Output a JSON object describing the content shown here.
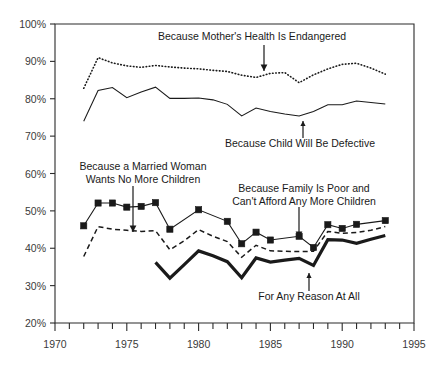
{
  "chart_data": {
    "type": "line",
    "title": "",
    "xlabel": "",
    "ylabel": "",
    "xlim": [
      1970,
      1995
    ],
    "ylim": [
      20,
      100
    ],
    "grid": false,
    "legend_position": "inline-annotations",
    "x_ticks_major": [
      "1970",
      "1975",
      "1980",
      "1985",
      "1990",
      "1995"
    ],
    "x_ticks_minor_step": 1,
    "y_ticks": [
      "20%",
      "30%",
      "40%",
      "50%",
      "60%",
      "70%",
      "80%",
      "90%",
      "100%"
    ],
    "series": [
      {
        "name": "Because Mother's Health Is Endangered",
        "style": "dotted",
        "marker": "none",
        "color": "#1a1a1a",
        "x": [
          1972,
          1973,
          1974,
          1975,
          1976,
          1977,
          1978,
          1979,
          1980,
          1981,
          1982,
          1983,
          1984,
          1985,
          1986,
          1987,
          1988,
          1989,
          1990,
          1991,
          1992,
          1993
        ],
        "values": [
          82.8,
          91.0,
          89.6,
          88.8,
          88.4,
          88.9,
          88.5,
          88.2,
          88.0,
          87.6,
          87.3,
          86.3,
          85.7,
          86.8,
          87.0,
          84.3,
          86.4,
          88.0,
          89.2,
          89.5,
          88.2,
          86.6
        ]
      },
      {
        "name": "Because Child Will Be Defective",
        "style": "solid-thin",
        "marker": "none",
        "color": "#1a1a1a",
        "x": [
          1972,
          1973,
          1974,
          1975,
          1976,
          1977,
          1978,
          1979,
          1980,
          1981,
          1982,
          1983,
          1984,
          1985,
          1986,
          1987,
          1988,
          1989,
          1990,
          1991,
          1992,
          1993
        ],
        "values": [
          74.0,
          82.2,
          83.0,
          80.3,
          81.8,
          83.1,
          80.1,
          80.1,
          80.2,
          79.7,
          78.5,
          75.4,
          77.5,
          76.6,
          75.9,
          75.4,
          76.6,
          78.4,
          78.4,
          79.4,
          79.0,
          78.6
        ]
      },
      {
        "name": "Because a Married Woman Wants No More Children",
        "style": "solid-marker",
        "marker": "square",
        "color": "#1a1a1a",
        "x": [
          1972,
          1973,
          1974,
          1975,
          1976,
          1977,
          1978,
          1980,
          1982,
          1983,
          1984,
          1985,
          1987,
          1988,
          1989,
          1990,
          1991,
          1993
        ],
        "values": [
          46.0,
          52.1,
          52.1,
          51.0,
          51.2,
          52.2,
          45.1,
          50.3,
          47.2,
          41.2,
          44.3,
          42.2,
          43.2,
          40.2,
          46.3,
          45.3,
          46.4,
          47.4
        ]
      },
      {
        "name": "Because Family Is Poor and Can't Afford Any More Children",
        "style": "dashed",
        "marker": "none",
        "color": "#1a1a1a",
        "x": [
          1972,
          1973,
          1974,
          1975,
          1976,
          1977,
          1978,
          1979,
          1980,
          1981,
          1982,
          1983,
          1984,
          1985,
          1986,
          1987,
          1988,
          1989,
          1990,
          1991,
          1992,
          1993
        ],
        "values": [
          37.8,
          45.8,
          45.1,
          44.8,
          44.5,
          44.7,
          39.6,
          42.0,
          45.0,
          43.2,
          41.8,
          37.6,
          40.8,
          39.3,
          39.2,
          39.1,
          39.2,
          44.5,
          44.0,
          44.2,
          44.8,
          45.8
        ]
      },
      {
        "name": "For Any Reason At All",
        "style": "solid-thick",
        "marker": "none",
        "color": "#1a1a1a",
        "x": [
          1977,
          1978,
          1979,
          1980,
          1981,
          1982,
          1983,
          1984,
          1985,
          1986,
          1987,
          1988,
          1989,
          1990,
          1991,
          1992,
          1993
        ],
        "values": [
          36.2,
          32.0,
          35.6,
          39.3,
          38.0,
          36.4,
          32.1,
          37.4,
          36.3,
          36.8,
          37.3,
          35.4,
          42.3,
          42.2,
          41.3,
          42.4,
          43.4
        ]
      }
    ],
    "annotations": [
      {
        "id": "annotation-mothers-health",
        "lines": [
          "Because Mother's Health Is Endangered"
        ],
        "text_x": 252,
        "text_y": 40,
        "arrow_from_x": 264,
        "arrow_from_y": 45,
        "arrow_to_x": 264,
        "arrow_to_y": 71
      },
      {
        "id": "annotation-child-defective",
        "lines": [
          "Because Child Will Be Defective"
        ],
        "text_x": 300,
        "text_y": 147,
        "arrow_from_x": 303,
        "arrow_from_y": 138,
        "arrow_to_x": 303,
        "arrow_to_y": 121
      },
      {
        "id": "annotation-married-woman",
        "lines": [
          "Because a Married Woman",
          "Wants No More Children"
        ],
        "text_x": 143,
        "text_y": 170,
        "arrow_from_x": 133,
        "arrow_from_y": 186,
        "arrow_to_x": 133,
        "arrow_to_y": 232
      },
      {
        "id": "annotation-family-poor",
        "lines": [
          "Because Family Is Poor and",
          "Can't Afford Any More Children"
        ],
        "text_x": 304,
        "text_y": 192,
        "arrow_from_x": 299,
        "arrow_from_y": 207,
        "arrow_to_x": 299,
        "arrow_to_y": 238
      },
      {
        "id": "annotation-any-reason",
        "lines": [
          "For Any Reason At All"
        ],
        "text_x": 309,
        "text_y": 300,
        "arrow_from_x": 309,
        "arrow_from_y": 291,
        "arrow_to_x": 309,
        "arrow_to_y": 273
      }
    ]
  }
}
